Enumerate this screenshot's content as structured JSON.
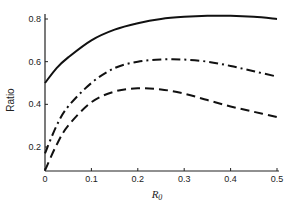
{
  "chart_data": {
    "type": "line",
    "title": "",
    "xlabel": "R_0",
    "xlabel_display": "R",
    "xlabel_sub": "0",
    "ylabel": "Ratio",
    "xlim": [
      0,
      0.5
    ],
    "ylim": [
      0.087,
      0.82
    ],
    "grid": false,
    "legend": null,
    "x_ticks": [
      "0",
      "0.1",
      "0.2",
      "0.3",
      "0.4",
      "0.5"
    ],
    "y_ticks": [
      "0.2",
      "0.4",
      "0.6",
      "0.8"
    ],
    "x": [
      0,
      0.025,
      0.05,
      0.1,
      0.15,
      0.2,
      0.25,
      0.3,
      0.35,
      0.4,
      0.45,
      0.5
    ],
    "series": [
      {
        "name": "solid",
        "style": "solid",
        "values": [
          0.5,
          0.57,
          0.62,
          0.7,
          0.75,
          0.78,
          0.8,
          0.81,
          0.815,
          0.815,
          0.81,
          0.8
        ]
      },
      {
        "name": "dash-dot",
        "style": "dashdot",
        "values": [
          0.17,
          0.3,
          0.39,
          0.5,
          0.57,
          0.6,
          0.61,
          0.61,
          0.6,
          0.58,
          0.555,
          0.53
        ]
      },
      {
        "name": "dashed",
        "style": "dashed",
        "values": [
          0.09,
          0.21,
          0.3,
          0.41,
          0.46,
          0.475,
          0.47,
          0.45,
          0.42,
          0.39,
          0.365,
          0.34
        ]
      }
    ]
  }
}
